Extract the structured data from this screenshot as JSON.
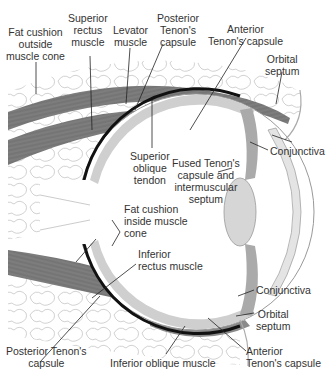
{
  "figure": {
    "colors": {
      "muscle": "#7a7a7a",
      "muscle_light": "#a8a8a8",
      "fat_outline": "#b5b5b5",
      "sclera_band": "#cfcfcf",
      "choroid_black": "#111111",
      "lens": "#d6d6d6",
      "leader_line": "#222222"
    }
  },
  "labels": {
    "fat_cushion_outside": {
      "lines": [
        "Fat cushion",
        "outside",
        "muscle cone"
      ]
    },
    "superior_rectus": {
      "lines": [
        "Superior",
        "rectus",
        "muscle"
      ]
    },
    "levator": {
      "lines": [
        "Levator",
        "muscle"
      ]
    },
    "posterior_tenon_top": {
      "lines": [
        "Posterior",
        "Tenon's",
        "capsule"
      ]
    },
    "anterior_tenon_top": {
      "lines": [
        "Anterior",
        "Tenon's capsule"
      ]
    },
    "orbital_septum_top": {
      "lines": [
        "Orbital",
        "septum"
      ]
    },
    "superior_oblique": {
      "lines": [
        "Superior",
        "oblique",
        "tendon"
      ]
    },
    "conjunctiva_top": {
      "lines": [
        "Conjunctiva"
      ]
    },
    "fused_tenon": {
      "lines": [
        "Fused Tenon's",
        "capsule and",
        "intermuscular",
        "septum"
      ]
    },
    "fat_cushion_inside": {
      "lines": [
        "Fat cushion",
        "inside muscle",
        "cone"
      ]
    },
    "inferior_rectus": {
      "lines": [
        "Inferior",
        "rectus muscle"
      ]
    },
    "conjunctiva_bottom": {
      "lines": [
        "Conjunctiva"
      ]
    },
    "orbital_septum_bottom": {
      "lines": [
        "Orbital",
        "septum"
      ]
    },
    "posterior_tenon_bottom": {
      "lines": [
        "Posterior Tenon's",
        "capsule"
      ]
    },
    "inferior_oblique": {
      "lines": [
        "Inferior oblique muscle"
      ]
    },
    "anterior_tenon_bottom": {
      "lines": [
        "Anterior",
        "Tenon's capsule"
      ]
    }
  }
}
